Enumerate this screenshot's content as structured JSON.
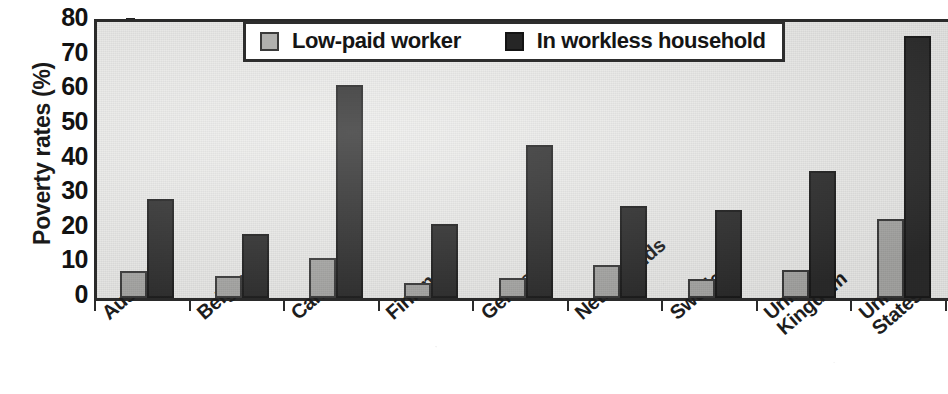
{
  "chart_data": {
    "type": "bar",
    "title": "",
    "xlabel": "",
    "ylabel": "Poverty rates (%)",
    "ylim": [
      0,
      80
    ],
    "ytick_values": [
      0,
      10,
      20,
      30,
      40,
      50,
      60,
      70,
      80
    ],
    "ytick_labels": [
      "0",
      "10",
      "20",
      "30",
      "40",
      "50",
      "60",
      "70",
      "80"
    ],
    "grid": false,
    "legend_position": "top-center",
    "categories": [
      "Australia",
      "Belgium",
      "Canada",
      "Finland",
      "Germany",
      "Netherlands",
      "Sweden",
      "United Kingdom",
      "United States"
    ],
    "category_label_lines": [
      [
        "Australia"
      ],
      [
        "Belgium"
      ],
      [
        "Canada"
      ],
      [
        "Finland"
      ],
      [
        "Germany"
      ],
      [
        "Netherlands"
      ],
      [
        "Sweden"
      ],
      [
        "United",
        "Kingdom"
      ],
      [
        "United",
        "States"
      ]
    ],
    "series": [
      {
        "name": "Low-paid worker",
        "color": "#a9a9a7",
        "values": [
          7.7,
          6.4,
          11.5,
          4.3,
          5.7,
          9.4,
          5.4,
          8.0,
          22.9
        ]
      },
      {
        "name": "In workless household",
        "color": "#2b2b2b",
        "values": [
          28.6,
          18.6,
          61.4,
          21.4,
          44.3,
          26.6,
          25.4,
          36.6,
          75.7
        ]
      }
    ]
  },
  "legend": {
    "items": [
      {
        "label": "Low-paid worker",
        "swatch": "light"
      },
      {
        "label": "In workless household",
        "swatch": "dark"
      }
    ]
  },
  "colors": {
    "plot_background": "#ededeb",
    "axis": "#2a2a2a",
    "low_paid": "#a9a9a7",
    "workless": "#2b2b2b",
    "text": "#151515"
  }
}
